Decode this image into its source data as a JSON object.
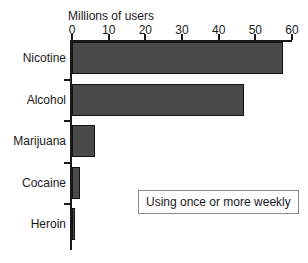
{
  "chart_data": {
    "type": "bar",
    "orientation": "horizontal",
    "title": "",
    "xlabel": "Millions of users",
    "ylabel": "",
    "categories": [
      "Nicotine",
      "Alcohol",
      "Marijuana",
      "Cocaine",
      "Heroin"
    ],
    "values": [
      57.5,
      47,
      6.3,
      2.2,
      0.5
    ],
    "xlim": [
      0,
      60
    ],
    "xticks": [
      0,
      10,
      20,
      30,
      40,
      50,
      60
    ],
    "xtick_labels": [
      "0",
      "10",
      "20",
      "30",
      "40",
      "50",
      "60"
    ],
    "grid": false,
    "legend": null,
    "annotations": [
      "Using once or more weekly"
    ],
    "bar_color": "#4a4a4a",
    "bar_edge_color": "#111111",
    "background_color": "#ffffff"
  },
  "axis": {
    "title": "Millions of users",
    "ticks": [
      {
        "label": "0",
        "value": 0
      },
      {
        "label": "10",
        "value": 10
      },
      {
        "label": "20",
        "value": 20
      },
      {
        "label": "30",
        "value": 30
      },
      {
        "label": "40",
        "value": 40
      },
      {
        "label": "50",
        "value": 50
      },
      {
        "label": "60",
        "value": 60
      }
    ]
  },
  "bars": [
    {
      "label": "Nicotine",
      "value": 57.5
    },
    {
      "label": "Alcohol",
      "value": 47
    },
    {
      "label": "Marijuana",
      "value": 6.3
    },
    {
      "label": "Cocaine",
      "value": 2.2
    },
    {
      "label": "Heroin",
      "value": 0.5
    }
  ],
  "annotation": {
    "text": "Using once or more weekly"
  }
}
